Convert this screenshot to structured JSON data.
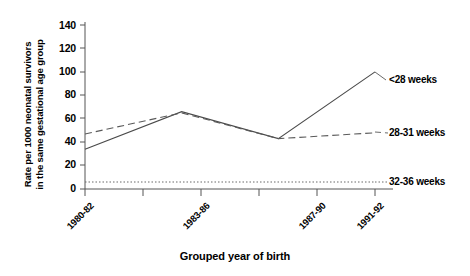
{
  "chart_data": {
    "type": "line",
    "title": "",
    "xlabel": "Grouped year of birth",
    "ylabel": "Rate per 1000 neonatal survivors in the same gestational age group",
    "ylabel_line1": "Rate per 1000 neonatal survivors",
    "ylabel_line2": "in the same gestational age group",
    "categories": [
      "1980-82",
      "1983-86",
      "1987-90",
      "1991-92"
    ],
    "ylim": [
      0,
      140
    ],
    "yticks": [
      0,
      20,
      40,
      60,
      80,
      100,
      120,
      140
    ],
    "grid": false,
    "legend_position": "right-inline-labels",
    "series": [
      {
        "name": "<28 weeks",
        "style": "solid",
        "color": "#000000",
        "values": [
          34,
          66,
          43,
          100
        ]
      },
      {
        "name": "28-31 weeks",
        "style": "dashed",
        "color": "#000000",
        "values": [
          47,
          65,
          43,
          48
        ]
      },
      {
        "name": "32-36 weeks",
        "style": "dotted",
        "color": "#000000",
        "values": [
          6,
          6,
          6,
          6
        ]
      }
    ]
  },
  "axes": {
    "y_ticks": [
      {
        "value": "140"
      },
      {
        "value": "120"
      },
      {
        "value": "100"
      },
      {
        "value": "80"
      },
      {
        "value": "60"
      },
      {
        "value": "40"
      },
      {
        "value": "20"
      },
      {
        "value": "0"
      }
    ],
    "x_ticks": [
      {
        "label": "1980-82"
      },
      {
        "label": "1983-86"
      },
      {
        "label": "1987-90"
      },
      {
        "label": "1991-92"
      }
    ],
    "x_title": "Grouped year of birth",
    "y_title_line1": "Rate per 1000 neonatal survivors",
    "y_title_line2": "in the same gestational age group"
  },
  "series_labels": [
    {
      "text": "<28 weeks"
    },
    {
      "text": "28-31 weeks"
    },
    {
      "text": "32-36 weeks"
    }
  ]
}
